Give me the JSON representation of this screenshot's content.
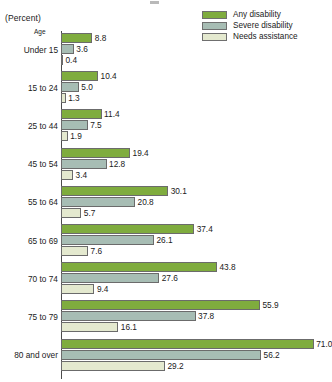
{
  "axis_unit_label": "(Percent)",
  "category_axis_caption": "Age",
  "legend": {
    "items": [
      {
        "label": "Any disability",
        "color": "#7fac3e",
        "key": "any"
      },
      {
        "label": "Severe disability",
        "color": "#a7bdb4",
        "key": "severe"
      },
      {
        "label": "Needs assistance",
        "color": "#e4e9cf",
        "key": "assist"
      }
    ]
  },
  "chart_data": {
    "type": "bar",
    "orientation": "horizontal",
    "title": "",
    "subtitle": "",
    "xlabel": "(Percent)",
    "ylabel": "Age",
    "grid": false,
    "legend_position": "top-right",
    "xlim": [
      0,
      71
    ],
    "categories": [
      "Under 15",
      "15 to 24",
      "25 to 44",
      "45 to 54",
      "55 to 64",
      "65 to 69",
      "70 to 74",
      "75 to 79",
      "80 and over"
    ],
    "series": [
      {
        "name": "Any disability",
        "color": "#7fac3e",
        "values": [
          8.8,
          10.4,
          11.4,
          19.4,
          30.1,
          37.4,
          43.8,
          55.9,
          71.0
        ]
      },
      {
        "name": "Severe disability",
        "color": "#a7bdb4",
        "values": [
          3.6,
          5.0,
          7.5,
          12.8,
          20.8,
          26.1,
          27.6,
          37.8,
          56.2
        ]
      },
      {
        "name": "Needs assistance",
        "color": "#e4e9cf",
        "values": [
          0.4,
          1.3,
          1.9,
          3.4,
          5.7,
          7.6,
          9.4,
          16.1,
          29.2
        ]
      }
    ],
    "value_labels": [
      [
        "8.8",
        "3.6",
        "0.4"
      ],
      [
        "10.4",
        "5.0",
        "1.3"
      ],
      [
        "11.4",
        "7.5",
        "1.9"
      ],
      [
        "19.4",
        "12.8",
        "3.4"
      ],
      [
        "30.1",
        "20.8",
        "5.7"
      ],
      [
        "37.4",
        "26.1",
        "7.6"
      ],
      [
        "43.8",
        "27.6",
        "9.4"
      ],
      [
        "55.9",
        "37.8",
        "16.1"
      ],
      [
        "71.0",
        "56.2",
        "29.2"
      ]
    ]
  }
}
